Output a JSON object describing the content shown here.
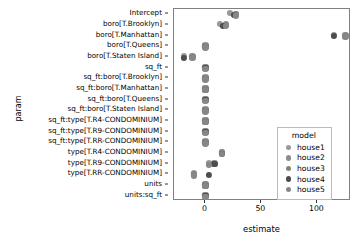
{
  "chart_data": {
    "type": "scatter",
    "title": "",
    "xlabel": "estimate",
    "ylabel": "param",
    "xlim": [
      -28,
      130
    ],
    "xticks": [
      0,
      50,
      100
    ],
    "xticklabels": [
      "0",
      "50",
      "100"
    ],
    "grid": false,
    "legend": {
      "position": "right-inside",
      "title": "model",
      "entries": [
        {
          "name": "house1",
          "color": "#999999"
        },
        {
          "name": "house2",
          "color": "#8d8d8d"
        },
        {
          "name": "house3",
          "color": "#828282"
        },
        {
          "name": "house4",
          "color": "#4d4d4d"
        },
        {
          "name": "house5",
          "color": "#878787"
        }
      ]
    },
    "categories": [
      "Intercept",
      "boro[T.Brooklyn]",
      "boro[T.Manhattan]",
      "boro[T.Queens]",
      "boro[T.Staten Island]",
      "sq_ft",
      "sq_ft:boro[T.Brooklyn]",
      "sq_ft:boro[T.Manhattan]",
      "sq_ft:boro[T.Queens]",
      "sq_ft:boro[T.Staten Island]",
      "sq_ft:type[T.R4-CONDOMINIUM]",
      "sq_ft:type[T.R9-CONDOMINIUM]",
      "sq_ft:type[T.RR-CONDOMINIUM]",
      "type[T.R4-CONDOMINIUM]",
      "type[T.R9-CONDOMINIUM]",
      "type[T.RR-CONDOMINIUM]",
      "units",
      "units:sq_ft"
    ],
    "series": [
      {
        "name": "house1",
        "color": "#999999",
        "points": [
          {
            "param": "Intercept",
            "estimate": 22.2
          },
          {
            "param": "boro[T.Brooklyn]",
            "estimate": 13.0
          },
          {
            "param": "boro[T.Manhattan]",
            "estimate": 115.0
          },
          {
            "param": "boro[T.Queens]",
            "estimate": 0.0
          },
          {
            "param": "boro[T.Staten Island]",
            "estimate": -19.5
          },
          {
            "param": "sq_ft",
            "estimate": 0.0
          },
          {
            "param": "sq_ft:boro[T.Brooklyn]",
            "estimate": 0.0
          },
          {
            "param": "sq_ft:boro[T.Manhattan]",
            "estimate": 0.0
          },
          {
            "param": "sq_ft:boro[T.Queens]",
            "estimate": 0.0
          },
          {
            "param": "sq_ft:boro[T.Staten Island]",
            "estimate": 0.0
          },
          {
            "param": "sq_ft:type[T.R4-CONDOMINIUM]",
            "estimate": 0.0
          },
          {
            "param": "sq_ft:type[T.R9-CONDOMINIUM]",
            "estimate": 0.0
          },
          {
            "param": "sq_ft:type[T.RR-CONDOMINIUM]",
            "estimate": 0.0
          },
          {
            "param": "type[T.R4-CONDOMINIUM]",
            "estimate": 14.5
          },
          {
            "param": "type[T.R9-CONDOMINIUM]",
            "estimate": 3.0
          },
          {
            "param": "type[T.RR-CONDOMINIUM]",
            "estimate": -10.5
          },
          {
            "param": "units",
            "estimate": 0.0
          },
          {
            "param": "units:sq_ft",
            "estimate": 0.0
          }
        ]
      },
      {
        "name": "house2",
        "color": "#8d8d8d",
        "points": [
          {
            "param": "Intercept",
            "estimate": 27.5
          },
          {
            "param": "boro[T.Brooklyn]",
            "estimate": 18.2
          },
          {
            "param": "boro[T.Manhattan]",
            "estimate": 125.0
          },
          {
            "param": "boro[T.Queens]",
            "estimate": 0.0
          },
          {
            "param": "boro[T.Staten Island]",
            "estimate": -11.5
          },
          {
            "param": "sq_ft",
            "estimate": 0.0
          },
          {
            "param": "sq_ft:boro[T.Brooklyn]",
            "estimate": 0.0
          },
          {
            "param": "sq_ft:boro[T.Manhattan]",
            "estimate": 0.0
          },
          {
            "param": "sq_ft:boro[T.Queens]",
            "estimate": 0.0
          },
          {
            "param": "sq_ft:boro[T.Staten Island]",
            "estimate": 0.0
          },
          {
            "param": "sq_ft:type[T.R4-CONDOMINIUM]",
            "estimate": 0.0
          },
          {
            "param": "sq_ft:type[T.R9-CONDOMINIUM]",
            "estimate": 0.0
          },
          {
            "param": "sq_ft:type[T.RR-CONDOMINIUM]",
            "estimate": 0.0
          },
          {
            "param": "type[T.R4-CONDOMINIUM]",
            "estimate": 14.5
          },
          {
            "param": "type[T.R9-CONDOMINIUM]",
            "estimate": 8.0
          },
          {
            "param": "type[T.RR-CONDOMINIUM]",
            "estimate": -10.5
          },
          {
            "param": "units",
            "estimate": 0.0
          },
          {
            "param": "units:sq_ft",
            "estimate": 0.0
          }
        ]
      },
      {
        "name": "house3",
        "color": "#828282",
        "points": [
          {
            "param": "Intercept",
            "estimate": 27.5
          },
          {
            "param": "boro[T.Brooklyn]",
            "estimate": 18.2
          },
          {
            "param": "boro[T.Manhattan]",
            "estimate": 125.0
          },
          {
            "param": "boro[T.Queens]",
            "estimate": 0.0
          },
          {
            "param": "boro[T.Staten Island]",
            "estimate": -11.5
          },
          {
            "param": "sq_ft",
            "estimate": 0.0
          },
          {
            "param": "sq_ft:boro[T.Brooklyn]",
            "estimate": 0.0
          },
          {
            "param": "sq_ft:boro[T.Manhattan]",
            "estimate": 0.0
          },
          {
            "param": "sq_ft:boro[T.Queens]",
            "estimate": 0.0
          },
          {
            "param": "sq_ft:boro[T.Staten Island]",
            "estimate": 0.0
          },
          {
            "param": "sq_ft:type[T.R4-CONDOMINIUM]",
            "estimate": 0.0
          },
          {
            "param": "sq_ft:type[T.R9-CONDOMINIUM]",
            "estimate": 0.0
          },
          {
            "param": "sq_ft:type[T.RR-CONDOMINIUM]",
            "estimate": 0.0
          },
          {
            "param": "type[T.R4-CONDOMINIUM]",
            "estimate": 14.5
          },
          {
            "param": "type[T.R9-CONDOMINIUM]",
            "estimate": 8.0
          },
          {
            "param": "type[T.RR-CONDOMINIUM]",
            "estimate": -10.5
          },
          {
            "param": "units",
            "estimate": 0.0
          },
          {
            "param": "units:sq_ft",
            "estimate": 0.0
          }
        ]
      },
      {
        "name": "house4",
        "color": "#4d4d4d",
        "points": [
          {
            "param": "Intercept",
            "estimate": 26.0
          },
          {
            "param": "boro[T.Brooklyn]",
            "estimate": 15.5
          },
          {
            "param": "boro[T.Manhattan]",
            "estimate": 115.0
          },
          {
            "param": "boro[T.Queens]",
            "estimate": 0.0
          },
          {
            "param": "boro[T.Staten Island]",
            "estimate": -19.5
          },
          {
            "param": "sq_ft",
            "estimate": 0.0
          },
          {
            "param": "sq_ft:boro[T.Brooklyn]",
            "estimate": 0.0
          },
          {
            "param": "sq_ft:boro[T.Manhattan]",
            "estimate": 0.0
          },
          {
            "param": "sq_ft:boro[T.Queens]",
            "estimate": 0.0
          },
          {
            "param": "sq_ft:boro[T.Staten Island]",
            "estimate": 0.0
          },
          {
            "param": "sq_ft:type[T.R4-CONDOMINIUM]",
            "estimate": 0.0
          },
          {
            "param": "sq_ft:type[T.R9-CONDOMINIUM]",
            "estimate": 0.0
          },
          {
            "param": "sq_ft:type[T.RR-CONDOMINIUM]",
            "estimate": 0.0
          },
          {
            "param": "type[T.R4-CONDOMINIUM]",
            "estimate": 14.5
          },
          {
            "param": "type[T.R9-CONDOMINIUM]",
            "estimate": 8.0
          },
          {
            "param": "type[T.RR-CONDOMINIUM]",
            "estimate": 3.5
          },
          {
            "param": "units",
            "estimate": 0.0
          },
          {
            "param": "units:sq_ft",
            "estimate": 0.0
          }
        ]
      },
      {
        "name": "house5",
        "color": "#878787",
        "points": [
          {
            "param": "Intercept",
            "estimate": 27.5
          },
          {
            "param": "boro[T.Brooklyn]",
            "estimate": 18.2
          },
          {
            "param": "boro[T.Manhattan]",
            "estimate": 125.0
          },
          {
            "param": "boro[T.Queens]",
            "estimate": 0.0
          },
          {
            "param": "boro[T.Staten Island]",
            "estimate": -11.5
          },
          {
            "param": "sq_ft",
            "estimate": 0.0
          },
          {
            "param": "sq_ft:boro[T.Brooklyn]",
            "estimate": 0.0
          },
          {
            "param": "sq_ft:boro[T.Manhattan]",
            "estimate": 0.0
          },
          {
            "param": "sq_ft:boro[T.Queens]",
            "estimate": 0.0
          },
          {
            "param": "sq_ft:boro[T.Staten Island]",
            "estimate": 0.0
          },
          {
            "param": "sq_ft:type[T.R4-CONDOMINIUM]",
            "estimate": 0.0
          },
          {
            "param": "sq_ft:type[T.R9-CONDOMINIUM]",
            "estimate": 0.0
          },
          {
            "param": "sq_ft:type[T.RR-CONDOMINIUM]",
            "estimate": 0.0
          },
          {
            "param": "type[T.R4-CONDOMINIUM]",
            "estimate": 14.5
          },
          {
            "param": "type[T.R9-CONDOMINIUM]",
            "estimate": 3.0
          },
          {
            "param": "type[T.RR-CONDOMINIUM]",
            "estimate": -10.5
          },
          {
            "param": "units",
            "estimate": 0.0
          },
          {
            "param": "units:sq_ft",
            "estimate": 0.0
          }
        ]
      }
    ]
  }
}
